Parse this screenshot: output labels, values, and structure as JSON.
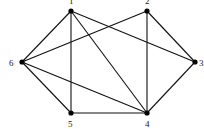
{
  "diagram": {
    "type": "undirected-graph",
    "colors": {
      "edge": "#111111",
      "node": "#000000",
      "label": "#222222",
      "background": "#ffffff"
    },
    "nodes": [
      {
        "id": "1",
        "label": "1",
        "x": 71,
        "y": 11,
        "lx": 69,
        "ly": 4
      },
      {
        "id": "2",
        "label": "2",
        "x": 147,
        "y": 11,
        "lx": 145,
        "ly": 4
      },
      {
        "id": "3",
        "label": "3",
        "x": 195,
        "y": 62,
        "lx": 199,
        "ly": 66
      },
      {
        "id": "4",
        "label": "4",
        "x": 147,
        "y": 113,
        "lx": 145,
        "ly": 127
      },
      {
        "id": "5",
        "label": "5",
        "x": 71,
        "y": 113,
        "lx": 68,
        "ly": 127
      },
      {
        "id": "6",
        "label": "6",
        "x": 22,
        "y": 62,
        "lx": 9,
        "ly": 66
      }
    ],
    "edges": [
      {
        "from": "1",
        "to": "6"
      },
      {
        "from": "1",
        "to": "5"
      },
      {
        "from": "1",
        "to": "4"
      },
      {
        "from": "1",
        "to": "3"
      },
      {
        "from": "2",
        "to": "6"
      },
      {
        "from": "2",
        "to": "4"
      },
      {
        "from": "2",
        "to": "3"
      },
      {
        "from": "6",
        "to": "5"
      },
      {
        "from": "6",
        "to": "4"
      },
      {
        "from": "5",
        "to": "4"
      },
      {
        "from": "4",
        "to": "3"
      }
    ]
  }
}
